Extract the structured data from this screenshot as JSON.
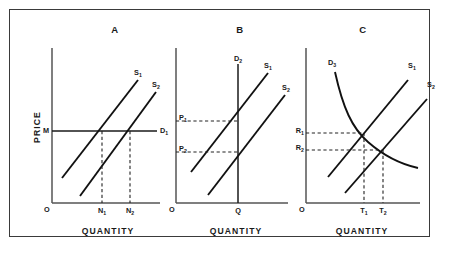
{
  "figure": {
    "type": "economics-supply-demand-diagram",
    "panel_count": 3,
    "axis_titles": {
      "y": "PRICE",
      "x": "QUANTITY"
    },
    "origin_label": "O"
  },
  "panels": [
    {
      "id": "A",
      "label": "A",
      "description": "Perfectly elastic demand: horizontal demand line D1 at price M; supply shift from S1 to S2 raises quantity from N1 to N2 at constant price.",
      "xlabel": "QUANTITY",
      "ylabel": "PRICE",
      "origin": "O",
      "curves": [
        {
          "name": "S1",
          "label": "S",
          "sub": "1",
          "kind": "supply",
          "shape": "line-upward"
        },
        {
          "name": "S2",
          "label": "S",
          "sub": "2",
          "kind": "supply",
          "shape": "line-upward"
        },
        {
          "name": "D1",
          "label": "D",
          "sub": "1",
          "kind": "demand",
          "shape": "horizontal"
        }
      ],
      "price_marks": [
        {
          "label": "M",
          "sub": ""
        }
      ],
      "quantity_marks": [
        {
          "label": "N",
          "sub": "1"
        },
        {
          "label": "N",
          "sub": "2"
        }
      ]
    },
    {
      "id": "B",
      "label": "B",
      "description": "Perfectly inelastic demand: vertical demand line D2 at quantity Q; supply shift from S1 to S2 lowers price from P1 to P2 at constant quantity.",
      "xlabel": "QUANTITY",
      "ylabel": "PRICE",
      "origin": "O",
      "curves": [
        {
          "name": "S1",
          "label": "S",
          "sub": "1",
          "kind": "supply",
          "shape": "line-upward"
        },
        {
          "name": "S2",
          "label": "S",
          "sub": "2",
          "kind": "supply",
          "shape": "line-upward"
        },
        {
          "name": "D2",
          "label": "D",
          "sub": "2",
          "kind": "demand",
          "shape": "vertical"
        }
      ],
      "price_marks": [
        {
          "label": "P",
          "sub": "1"
        },
        {
          "label": "P",
          "sub": "2"
        }
      ],
      "quantity_marks": [
        {
          "label": "Q",
          "sub": ""
        }
      ]
    },
    {
      "id": "C",
      "label": "C",
      "description": "Normal downward-sloping demand D3: supply shift from S1 to S2 lowers price from R1 to R2 and raises quantity from T1 to T2.",
      "xlabel": "QUANTITY",
      "ylabel": "PRICE",
      "origin": "O",
      "curves": [
        {
          "name": "S1",
          "label": "S",
          "sub": "1",
          "kind": "supply",
          "shape": "line-upward"
        },
        {
          "name": "S2",
          "label": "S",
          "sub": "2",
          "kind": "supply",
          "shape": "line-upward"
        },
        {
          "name": "D3",
          "label": "D",
          "sub": "3",
          "kind": "demand",
          "shape": "curve-downward"
        }
      ],
      "price_marks": [
        {
          "label": "R",
          "sub": "1"
        },
        {
          "label": "R",
          "sub": "2"
        }
      ],
      "quantity_marks": [
        {
          "label": "T",
          "sub": "1"
        },
        {
          "label": "T",
          "sub": "2"
        }
      ]
    }
  ],
  "colors": {
    "ink": "#1a1a1a",
    "frame": "#3a3a3a",
    "axis": "#555555",
    "curve": "#111111",
    "dashed": "#222222",
    "background": "#ffffff"
  }
}
